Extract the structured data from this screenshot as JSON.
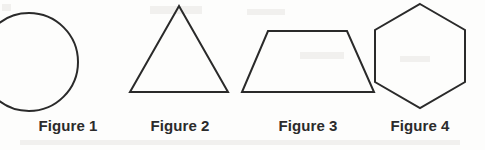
{
  "sheet": {
    "title": "Geometric figures worksheet",
    "background_color": "#fdfdfc",
    "stroke_color": "#2a2a2a",
    "label_color": "#2b2b2b",
    "stroke_width": 2,
    "width": 485,
    "height": 150
  },
  "figures": [
    {
      "label": "Figure 1",
      "shape": "circle",
      "shape_icon": "circle-icon",
      "geometry": {
        "cx": 21,
        "cy": 62,
        "r": 49
      }
    },
    {
      "label": "Figure 2",
      "shape": "triangle",
      "shape_icon": "triangle-icon",
      "geometry": {
        "points": "51,6 100,92 2,92"
      }
    },
    {
      "label": "Figure 3",
      "shape": "trapezoid",
      "shape_icon": "trapezoid-icon",
      "geometry": {
        "points": "30,31 109,31 136,92 4,92"
      }
    },
    {
      "label": "Figure 4",
      "shape": "hexagon",
      "shape_icon": "hexagon-icon",
      "geometry": {
        "points": "50,4 95,30 95,82 50,108 5,82 5,30"
      }
    }
  ]
}
